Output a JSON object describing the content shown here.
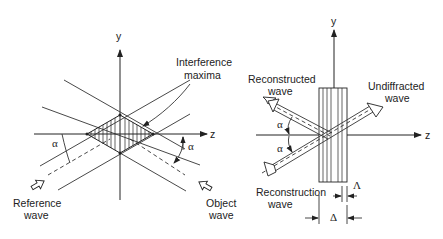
{
  "left_panel": {
    "axis_y": "y",
    "axis_z": "z",
    "interference_label_1": "Interference",
    "interference_label_2": "maxima",
    "alpha_left": "α",
    "alpha_right": "α",
    "reference_label_1": "Reference",
    "reference_label_2": "wave",
    "object_label_1": "Object",
    "object_label_2": "wave"
  },
  "right_panel": {
    "axis_y": "y",
    "axis_z": "z",
    "reconstructed_label_1": "Reconstructed",
    "reconstructed_label_2": "wave",
    "undiffracted_label_1": "Undiffracted",
    "undiffracted_label_2": "wave",
    "alpha_top": "α",
    "alpha_bottom": "α",
    "reconstruction_label_1": "Reconstruction",
    "reconstruction_label_2": "wave",
    "fringe_spacing": "Λ",
    "thickness": "Δ"
  }
}
